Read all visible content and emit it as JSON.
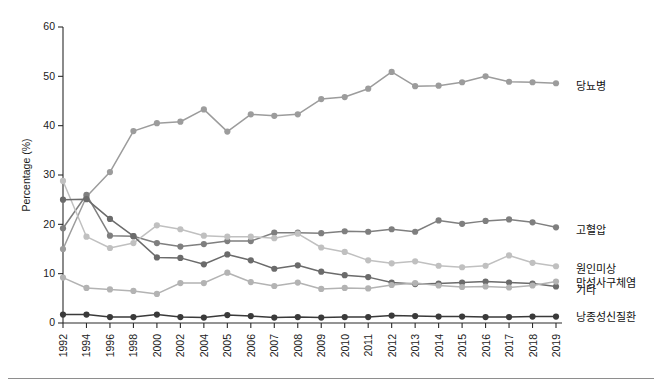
{
  "chart_data": {
    "type": "line",
    "title": "",
    "subtitle": "",
    "xlabel": "",
    "ylabel": "Percentage (%)",
    "ylim": [
      0,
      60
    ],
    "yticks": [
      0,
      10,
      20,
      30,
      40,
      50,
      60
    ],
    "grid": false,
    "legend_position": "right",
    "categories": [
      "1992",
      "1994",
      "1996",
      "1998",
      "2000",
      "2002",
      "2004",
      "2005",
      "2006",
      "2007",
      "2008",
      "2009",
      "2010",
      "2011",
      "2012",
      "2013",
      "2014",
      "2015",
      "2016",
      "2017",
      "2018",
      "2019"
    ],
    "series": [
      {
        "name": "당뇨병",
        "color": "#9c9c9c",
        "values": [
          15.0,
          25.6,
          30.6,
          38.9,
          40.5,
          40.8,
          43.3,
          38.8,
          42.3,
          42.0,
          42.3,
          45.4,
          45.8,
          47.5,
          50.9,
          48.0,
          48.1,
          48.8,
          50.0,
          48.9,
          48.8,
          48.6
        ]
      },
      {
        "name": "고혈압",
        "color": "#7f7f7f",
        "values": [
          19.2,
          26.0,
          17.7,
          17.6,
          16.2,
          15.5,
          16.0,
          16.6,
          16.6,
          18.3,
          18.3,
          18.2,
          18.6,
          18.5,
          19.0,
          18.5,
          20.8,
          20.1,
          20.7,
          21.0,
          20.4,
          19.4
        ]
      },
      {
        "name": "원인미상",
        "color": "#c0c0c0",
        "values": [
          28.8,
          17.5,
          15.2,
          16.2,
          19.8,
          19.0,
          17.7,
          17.5,
          17.5,
          17.2,
          18.1,
          15.3,
          14.4,
          12.7,
          12.1,
          12.5,
          11.6,
          11.3,
          11.6,
          13.7,
          12.2,
          11.5
        ]
      },
      {
        "name": "만성사구체염",
        "color": "#6b6b6b",
        "values": [
          25.0,
          25.1,
          21.1,
          17.6,
          13.3,
          13.2,
          11.9,
          13.9,
          12.7,
          11.0,
          11.7,
          10.4,
          9.7,
          9.3,
          8.2,
          7.9,
          8.0,
          8.2,
          8.4,
          8.2,
          8.0,
          7.4
        ]
      },
      {
        "name": "기타",
        "color": "#b3b3b3",
        "values": [
          9.2,
          7.1,
          6.8,
          6.5,
          5.9,
          8.1,
          8.1,
          10.2,
          8.3,
          7.5,
          8.2,
          6.9,
          7.1,
          7.0,
          7.7,
          8.1,
          7.6,
          7.3,
          7.4,
          7.2,
          7.6,
          8.4
        ]
      },
      {
        "name": "낭종성신질환",
        "color": "#3a3a3a",
        "values": [
          1.7,
          1.7,
          1.2,
          1.2,
          1.7,
          1.2,
          1.1,
          1.6,
          1.4,
          1.1,
          1.2,
          1.1,
          1.2,
          1.2,
          1.5,
          1.4,
          1.3,
          1.3,
          1.2,
          1.2,
          1.3,
          1.3
        ]
      }
    ],
    "legend": [
      {
        "label": "당뇨병",
        "color": "#9c9c9c"
      },
      {
        "label": "고혈압",
        "color": "#7f7f7f"
      },
      {
        "label": "원인미상",
        "color": "#c0c0c0"
      },
      {
        "label": "만성사구체염",
        "color": "#6b6b6b"
      },
      {
        "label": "기타",
        "color": "#b3b3b3"
      },
      {
        "label": "낭종성신질환",
        "color": "#3a3a3a"
      }
    ]
  }
}
